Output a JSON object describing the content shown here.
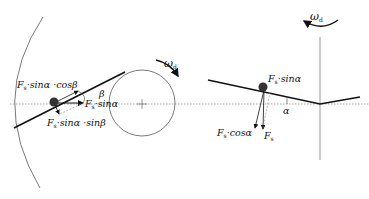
{
  "left_view": {
    "force_cos_beta": {
      "F": "F",
      "sub": "s",
      "rest": "·sinα ·cosβ"
    },
    "force_sin_alpha": {
      "F": "F",
      "sub": "s",
      "rest": "·sinα"
    },
    "force_sin_beta": {
      "F": "F",
      "sub": "s",
      "rest": "·sinα ·sinβ"
    },
    "angle": "β",
    "omega": {
      "symbol": "ω",
      "sub": "d"
    }
  },
  "right_view": {
    "force_sin_alpha": {
      "F": "F",
      "sub": "s",
      "rest": "·sinα"
    },
    "force_cos_alpha": {
      "F": "F",
      "sub": "s",
      "rest": "·cosα"
    },
    "force_total": {
      "F": "F",
      "sub": "s",
      "rest": ""
    },
    "angle": "α",
    "omega": {
      "symbol": "ω",
      "sub": "d"
    }
  },
  "colors": {
    "line": "#111111",
    "thin": "#555555",
    "dot": "#333333"
  }
}
